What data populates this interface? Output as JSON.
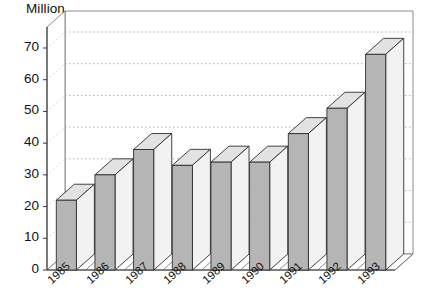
{
  "chart_data": {
    "type": "bar",
    "title": "Million",
    "subtitle": "",
    "xlabel": "",
    "ylabel": "Million",
    "categories": [
      "1985",
      "1986",
      "1987",
      "1988",
      "1989",
      "1990",
      "1991",
      "1992",
      "1993"
    ],
    "values": [
      22,
      30,
      38,
      33,
      34,
      34,
      43,
      51,
      68
    ],
    "series": [
      {
        "name": "Million",
        "values": [
          22,
          30,
          38,
          33,
          34,
          34,
          43,
          51,
          68
        ]
      }
    ],
    "ylim": [
      0,
      70
    ],
    "ytick_values": [
      0,
      10,
      20,
      30,
      40,
      50,
      60,
      70
    ],
    "ytick_labels": [
      "0",
      "10",
      "20",
      "30",
      "40",
      "50",
      "60",
      "70"
    ],
    "ytick_step": 10,
    "grid": true,
    "grid_style": "dotted-horizontal",
    "legend": false,
    "legend_position": "none",
    "projection": "3d-extruded-columns",
    "bar_face_color": "#b5b5b5",
    "bar_top_color": "#e2e2e2",
    "bar_side_color": "#f2f2f2",
    "bar_edge_color": "#2f2f2f",
    "background_color": "#ffffff",
    "axis_color": "#3a3a3a",
    "gridline_color": "#9a9a9a",
    "xtick_rotation_degrees": -42,
    "annotations": []
  },
  "chart": {
    "title_text": "Million",
    "y_axis": {
      "ticks": [
        {
          "label": "70",
          "value": 70
        },
        {
          "label": "60",
          "value": 60
        },
        {
          "label": "50",
          "value": 50
        },
        {
          "label": "40",
          "value": 40
        },
        {
          "label": "30",
          "value": 30
        },
        {
          "label": "20",
          "value": 20
        },
        {
          "label": "10",
          "value": 10
        },
        {
          "label": "0",
          "value": 0
        }
      ]
    },
    "x_axis": {
      "ticks": [
        {
          "label": "1985"
        },
        {
          "label": "1986"
        },
        {
          "label": "1987"
        },
        {
          "label": "1988"
        },
        {
          "label": "1989"
        },
        {
          "label": "1990"
        },
        {
          "label": "1991"
        },
        {
          "label": "1992"
        },
        {
          "label": "1993"
        }
      ]
    },
    "bars": [
      {
        "category": "1985",
        "value": 22
      },
      {
        "category": "1986",
        "value": 30
      },
      {
        "category": "1987",
        "value": 38
      },
      {
        "category": "1988",
        "value": 33
      },
      {
        "category": "1989",
        "value": 34
      },
      {
        "category": "1990",
        "value": 34
      },
      {
        "category": "1991",
        "value": 43
      },
      {
        "category": "1992",
        "value": 51
      },
      {
        "category": "1993",
        "value": 68
      }
    ]
  }
}
